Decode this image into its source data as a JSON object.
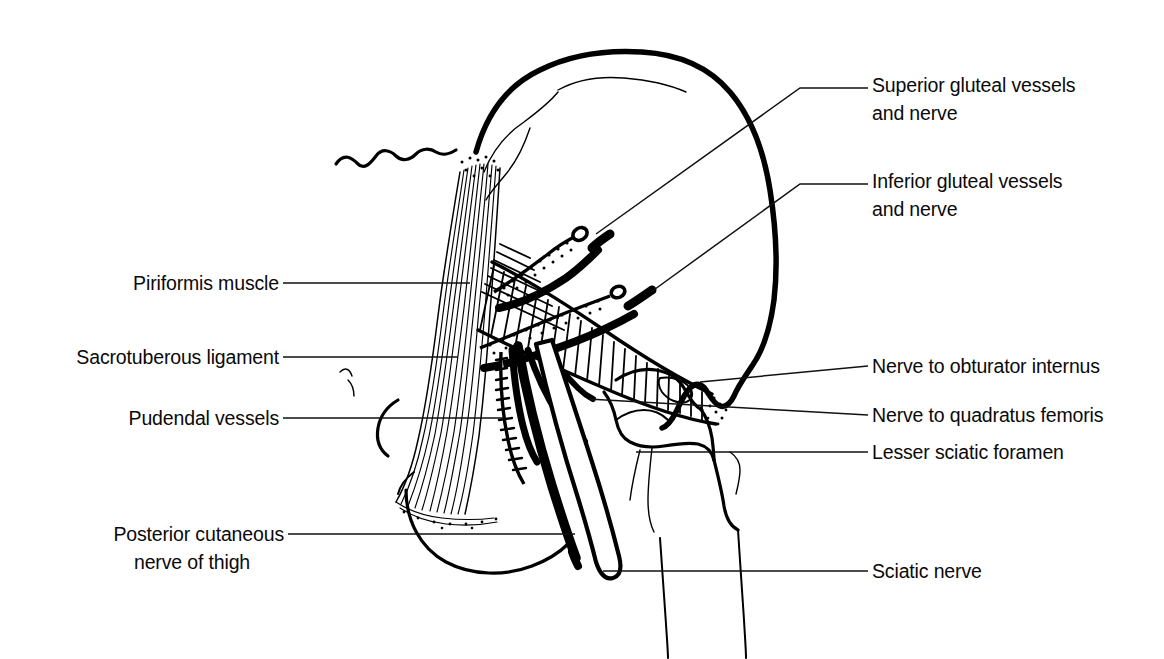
{
  "figure": {
    "background_color": "#ffffff",
    "ink_color": "#000000",
    "width": 1164,
    "height": 659
  },
  "labels": {
    "right": [
      {
        "id": "superior-gluteal",
        "lines": [
          "Superior gluteal vessels",
          "and nerve"
        ],
        "line1": "Superior gluteal vessels",
        "line2": "and nerve",
        "text_x": 872,
        "text_y": 92,
        "leader": "M 596,234 L 800,88 L 868,88"
      },
      {
        "id": "inferior-gluteal",
        "lines": [
          "Inferior gluteal vessels",
          "and nerve"
        ],
        "line1": "Inferior gluteal vessels",
        "line2": "and nerve",
        "text_x": 872,
        "text_y": 188,
        "leader": "M 651,292 L 800,184 L 868,184"
      },
      {
        "id": "nerve-obturator-internus",
        "lines": [
          "Nerve to obturator internus"
        ],
        "line1": "Nerve to obturator internus",
        "line2": "",
        "text_x": 872,
        "text_y": 370,
        "leader": "M 700,382 L 868,366"
      },
      {
        "id": "nerve-quadratus-femoris",
        "lines": [
          "Nerve to quadratus femoris"
        ],
        "line1": "Nerve to quadratus femoris",
        "line2": "",
        "text_x": 872,
        "text_y": 419,
        "leader": "M 588,399 L 868,415"
      },
      {
        "id": "lesser-sciatic-foramen",
        "lines": [
          "Lesser sciatic foramen"
        ],
        "line1": "Lesser sciatic foramen",
        "line2": "",
        "text_x": 872,
        "text_y": 456,
        "leader": "M 636,452 L 868,452"
      },
      {
        "id": "sciatic-nerve",
        "lines": [
          "Sciatic nerve"
        ],
        "line1": "Sciatic nerve",
        "line2": "",
        "text_x": 872,
        "text_y": 575,
        "leader": "M 603,571 L 868,571"
      }
    ],
    "left": [
      {
        "id": "piriformis-muscle",
        "lines": [
          "Piriformis muscle"
        ],
        "line1": "Piriformis muscle",
        "line2": "",
        "text_x": 278,
        "text_y": 289,
        "leader": "M 283,283 L 470,283"
      },
      {
        "id": "sacrotuberous-ligament",
        "lines": [
          "Sacrotuberous ligament"
        ],
        "line1": "Sacrotuberous ligament",
        "line2": "",
        "text_x": 278,
        "text_y": 362,
        "leader": "M 283,357 L 458,357"
      },
      {
        "id": "pudendal-vessels",
        "lines": [
          "Pudendal vessels"
        ],
        "line1": "Pudendal vessels",
        "line2": "",
        "text_x": 278,
        "text_y": 424,
        "leader": "M 283,418 L 505,418"
      },
      {
        "id": "posterior-cutaneous-nerve",
        "lines": [
          "Posterior cutaneous",
          "nerve of thigh"
        ],
        "line1": "Posterior cutaneous",
        "line2": "nerve of thigh",
        "text_x": 278,
        "text_y": 540,
        "leader": "M 288,534 L 575,534"
      }
    ]
  },
  "structures": [
    {
      "id": "ilium",
      "name": "Ilium (gluteal surface)",
      "style": "thick-outline"
    },
    {
      "id": "sacrum",
      "name": "Sacrum",
      "style": "thin-outline"
    },
    {
      "id": "greater-trochanter",
      "name": "Greater trochanter of femur",
      "style": "med-outline"
    },
    {
      "id": "femur-shaft",
      "name": "Femoral shaft",
      "style": "thin-outline"
    },
    {
      "id": "ischial-tuberosity",
      "name": "Ischial tuberosity",
      "style": "med-outline"
    },
    {
      "id": "sacrotuberous-ligament-fibers",
      "name": "Sacrotuberous ligament",
      "style": "parallel-fibers"
    },
    {
      "id": "piriformis-muscle-body",
      "name": "Piriformis muscle",
      "style": "hatched-belly"
    },
    {
      "id": "superior-gluteal-bundle",
      "name": "Superior gluteal vessels and nerve",
      "style": "stippled-vessel-with-nerve"
    },
    {
      "id": "inferior-gluteal-bundle",
      "name": "Inferior gluteal vessels and nerve",
      "style": "stippled-vessel-with-nerve"
    },
    {
      "id": "pudendal-bundle",
      "name": "Pudendal vessels",
      "style": "ladder-vessel"
    },
    {
      "id": "sciatic-nerve-band",
      "name": "Sciatic nerve",
      "style": "hollow-band"
    },
    {
      "id": "posterior-cutaneous-nerve-trunk",
      "name": "Posterior cutaneous nerve of thigh",
      "style": "solid-black-cord"
    },
    {
      "id": "obturator-internus-nerve",
      "name": "Nerve to obturator internus",
      "style": "solid-black-cord"
    },
    {
      "id": "quadratus-femoris-nerve",
      "name": "Nerve to quadratus femoris",
      "style": "solid-black-cord"
    }
  ]
}
